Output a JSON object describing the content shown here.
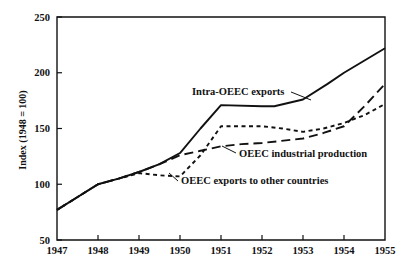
{
  "chart_data": {
    "type": "line",
    "title": "",
    "subtitle": "",
    "xlabel": "",
    "ylabel": "Index (1948 = 100)",
    "xlim": [
      1947,
      1955
    ],
    "ylim": [
      50,
      250
    ],
    "xticks": [
      1947,
      1948,
      1949,
      1950,
      1951,
      1952,
      1953,
      1954,
      1955
    ],
    "xticklabels": [
      "1947",
      "1948",
      "1949",
      "1950",
      "1951",
      "1952",
      "1953",
      "1954",
      "1955"
    ],
    "yticks": [
      50,
      100,
      150,
      200,
      250
    ],
    "yticklabels": [
      "50",
      "100",
      "150",
      "200",
      "250"
    ],
    "grid": false,
    "legend_position": "inline-annotations",
    "frame": "box",
    "series": [
      {
        "name": "Intra-OEEC exports",
        "style": "solid",
        "x": [
          1947,
          1948,
          1948.5,
          1949,
          1949.5,
          1950,
          1950.5,
          1951,
          1952,
          1952.3,
          1953,
          1953.6,
          1954,
          1954.5,
          1955
        ],
        "values": [
          77,
          100,
          105,
          111,
          118,
          128,
          150,
          171,
          170,
          170,
          176,
          190,
          200,
          211,
          222
        ]
      },
      {
        "name": "OEEC industrial production",
        "style": "long-dash",
        "x": [
          1947,
          1948,
          1948.5,
          1949,
          1949.5,
          1950,
          1950.5,
          1951,
          1951.5,
          1952,
          1953,
          1953.5,
          1954,
          1954.5,
          1955
        ],
        "values": [
          77,
          100,
          105,
          111,
          118,
          126,
          130,
          134,
          136,
          137,
          141,
          146,
          152,
          170,
          190
        ]
      },
      {
        "name": "OEEC exports to other countries",
        "style": "short-dash",
        "x": [
          1947,
          1948,
          1948.5,
          1949,
          1949.5,
          1950,
          1950.5,
          1951,
          1952,
          1952.5,
          1953,
          1953.5,
          1954,
          1954.5,
          1955
        ],
        "values": [
          77,
          100,
          105,
          110,
          108,
          107,
          126,
          152,
          152,
          150,
          147,
          150,
          155,
          162,
          172
        ]
      }
    ],
    "annotations": [
      {
        "text": "Intra-OEEC exports",
        "x_px": 192,
        "y_px": 95,
        "anchor": "start"
      },
      {
        "text": "OEEC industrial production",
        "x_px": 239,
        "y_px": 157,
        "anchor": "start"
      },
      {
        "text": "OEEC exports to other countries",
        "x_px": 181,
        "y_px": 184,
        "anchor": "start"
      }
    ],
    "colors": {
      "axis": "#111111",
      "series": "#111111",
      "background": "#ffffff"
    }
  }
}
